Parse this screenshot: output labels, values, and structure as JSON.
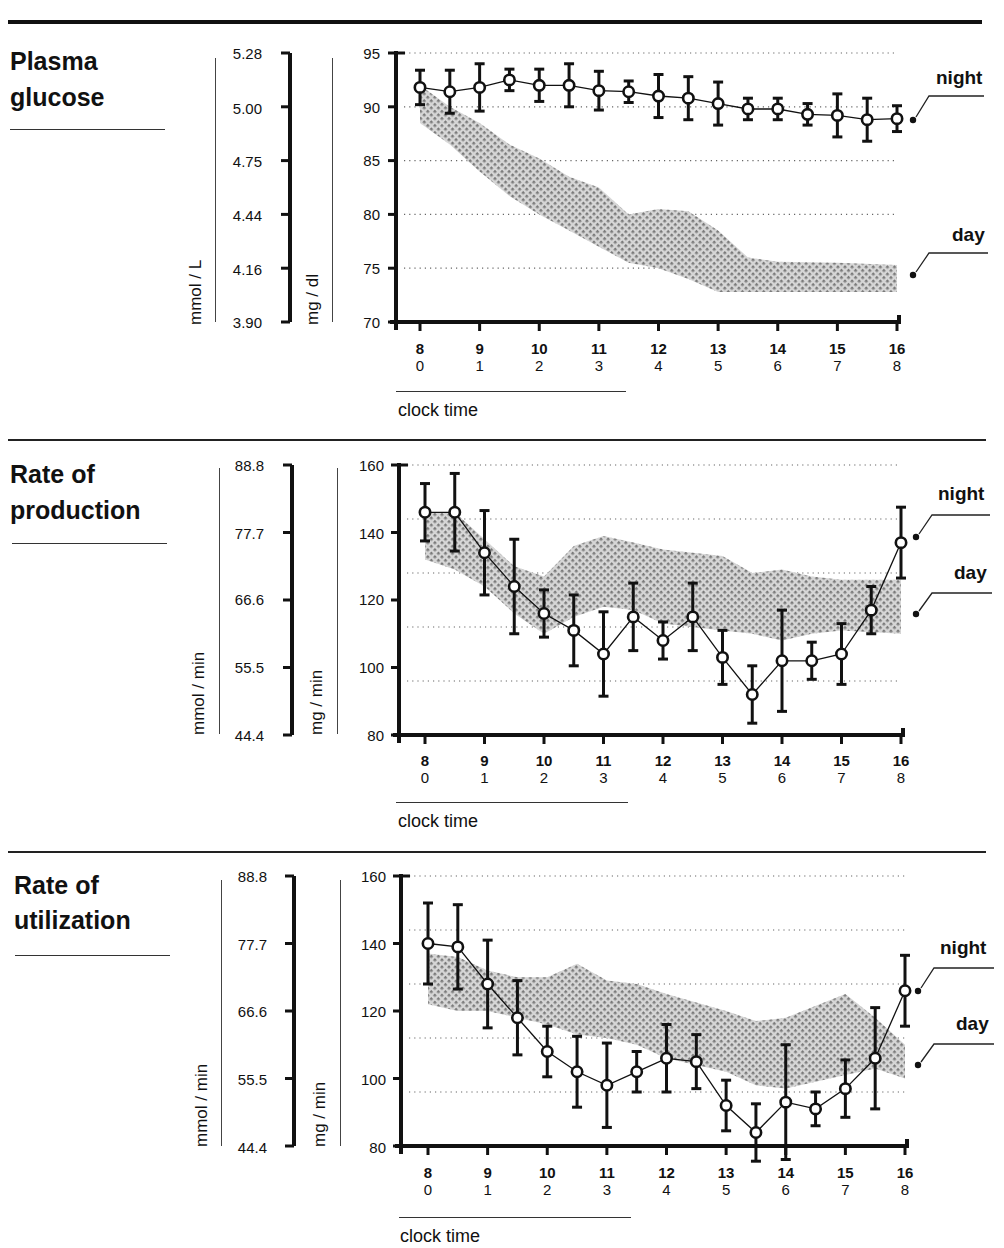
{
  "panels": [
    {
      "title_line1": "Plasma",
      "title_line2": "glucose",
      "left_unit": "mmol / L",
      "right_unit": "mg / dl",
      "left_ticks": [
        "5.28",
        "5.00",
        "4.75",
        "4.44",
        "4.16",
        "3.90"
      ],
      "right_ticks": [
        "95",
        "90",
        "85",
        "80",
        "75",
        "70"
      ],
      "legend_night": "night",
      "legend_day": "day",
      "x_clock": [
        "8",
        "9",
        "10",
        "11",
        "12",
        "13",
        "14",
        "15",
        "16"
      ],
      "x_hours": [
        "0",
        "1",
        "2",
        "3",
        "4",
        "5",
        "6",
        "7",
        "8"
      ],
      "x_caption": "clock time"
    },
    {
      "title_line1": "Rate of",
      "title_line2": "production",
      "left_unit": "mmol / min",
      "right_unit": "mg / min",
      "left_ticks": [
        "88.8",
        "77.7",
        "66.6",
        "55.5",
        "44.4"
      ],
      "right_ticks": [
        "160",
        "140",
        "120",
        "100",
        "80"
      ],
      "legend_night": "night",
      "legend_day": "day",
      "x_clock": [
        "8",
        "9",
        "10",
        "11",
        "12",
        "13",
        "14",
        "15",
        "16"
      ],
      "x_hours": [
        "0",
        "1",
        "2",
        "3",
        "4",
        "5",
        "6",
        "7",
        "8"
      ],
      "x_caption": "clock time"
    },
    {
      "title_line1": "Rate of",
      "title_line2": "utilization",
      "left_unit": "mmol / min",
      "right_unit": "mg / min",
      "left_ticks": [
        "88.8",
        "77.7",
        "66.6",
        "55.5",
        "44.4"
      ],
      "right_ticks": [
        "160",
        "140",
        "120",
        "100",
        "80"
      ],
      "legend_night": "night",
      "legend_day": "day",
      "x_clock": [
        "8",
        "9",
        "10",
        "11",
        "12",
        "13",
        "14",
        "15",
        "16"
      ],
      "x_hours": [
        "0",
        "1",
        "2",
        "3",
        "4",
        "5",
        "6",
        "7",
        "8"
      ],
      "x_caption": "clock time"
    }
  ],
  "chart_data": [
    {
      "type": "line",
      "title": "Plasma glucose",
      "xlabel": "clock time",
      "ylabel": "mg / dl",
      "ylabel_secondary": "mmol / L",
      "ylim": [
        70,
        95
      ],
      "x": [
        8,
        8.5,
        9,
        9.5,
        10,
        10.5,
        11,
        11.5,
        12,
        12.5,
        13,
        13.5,
        14,
        14.5,
        15,
        15.5,
        16
      ],
      "series": [
        {
          "name": "night",
          "style": "open-circles-with-error-bars",
          "values": [
            91.8,
            91.4,
            91.8,
            92.5,
            92.0,
            92.0,
            91.5,
            91.4,
            91.0,
            90.8,
            90.3,
            89.8,
            89.8,
            89.3,
            89.2,
            88.8,
            88.9
          ],
          "err": [
            1.6,
            2.0,
            2.2,
            1.0,
            1.5,
            2.0,
            1.8,
            1.0,
            2.0,
            2.0,
            2.0,
            1.0,
            1.0,
            1.0,
            2.0,
            2.0,
            1.2
          ]
        },
        {
          "name": "day",
          "style": "hatched-band",
          "upper": [
            92,
            90,
            88.5,
            86.5,
            85.2,
            83.5,
            82.5,
            80,
            80.5,
            80.3,
            78.5,
            76,
            75.6,
            75.5,
            75.3
          ],
          "lower": [
            88.5,
            86.5,
            84,
            81.7,
            80,
            78.5,
            77,
            75.5,
            75,
            74,
            72.8,
            72.8,
            72.8,
            72.8,
            72.8
          ],
          "band_x": [
            8,
            8.5,
            9,
            9.5,
            10,
            10.5,
            11,
            11.5,
            12,
            12.5,
            13,
            13.5,
            14,
            15,
            16
          ]
        }
      ],
      "gridlines": [
        75,
        80,
        85,
        90,
        95
      ],
      "grid": "dotted"
    },
    {
      "type": "line",
      "title": "Rate of production",
      "xlabel": "clock time",
      "ylabel": "mg / min",
      "ylabel_secondary": "mmol / min",
      "ylim": [
        80,
        160
      ],
      "x": [
        8,
        8.5,
        9,
        9.5,
        10,
        10.5,
        11,
        11.5,
        12,
        12.5,
        13,
        13.5,
        14,
        14.5,
        15,
        15.5,
        16
      ],
      "series": [
        {
          "name": "night",
          "style": "open-circles-with-error-bars",
          "values": [
            146,
            146,
            134,
            124,
            116,
            111,
            104,
            115,
            108,
            115,
            103,
            92,
            102,
            102,
            104,
            117,
            137
          ],
          "err": [
            8.5,
            11.5,
            12.5,
            14,
            7,
            10.5,
            12.5,
            10,
            5.5,
            10,
            8,
            8.5,
            15,
            5.5,
            9,
            7,
            10.5
          ]
        },
        {
          "name": "day",
          "style": "hatched-band",
          "upper": [
            146,
            146,
            138,
            130,
            127,
            136,
            139,
            137,
            135,
            133,
            128,
            129,
            127,
            126,
            126
          ],
          "lower": [
            132,
            129,
            124,
            116,
            110,
            115,
            118,
            117,
            113,
            111,
            110,
            108,
            110,
            111,
            110
          ],
          "band_x": [
            8,
            8.5,
            9,
            9.5,
            10,
            10.5,
            11,
            11.5,
            12,
            13,
            13.5,
            14,
            14.5,
            15,
            16
          ]
        }
      ],
      "gridlines": [
        96,
        112,
        128,
        144,
        160
      ],
      "grid": "dotted"
    },
    {
      "type": "line",
      "title": "Rate of utilization",
      "xlabel": "clock time",
      "ylabel": "mg / min",
      "ylabel_secondary": "mmol / min",
      "ylim": [
        80,
        160
      ],
      "x": [
        8,
        8.5,
        9,
        9.5,
        10,
        10.5,
        11,
        11.5,
        12,
        12.5,
        13,
        13.5,
        14,
        14.5,
        15,
        15.5,
        16
      ],
      "series": [
        {
          "name": "night",
          "style": "open-circles-with-error-bars",
          "values": [
            140,
            139,
            128,
            118,
            108,
            102,
            98,
            102,
            106,
            105,
            92,
            84,
            93,
            91,
            97,
            106,
            126
          ],
          "err": [
            12,
            12.5,
            13,
            11,
            7.5,
            10.5,
            12.5,
            6,
            10,
            8,
            7.5,
            8.5,
            17,
            5,
            8.5,
            15,
            10.5
          ]
        },
        {
          "name": "day",
          "style": "hatched-band",
          "upper": [
            137,
            136,
            132,
            130,
            130,
            134,
            129,
            128,
            125,
            120,
            117,
            118,
            125,
            118,
            110
          ],
          "lower": [
            122,
            120,
            120,
            118,
            116,
            113,
            112,
            110,
            106,
            102,
            98,
            97,
            101,
            103,
            100
          ],
          "band_x": [
            8,
            8.5,
            9,
            9.5,
            10,
            10.5,
            11,
            11.5,
            12,
            13,
            13.5,
            14,
            15,
            15.5,
            16
          ]
        }
      ],
      "gridlines": [
        96,
        112,
        128,
        144,
        160
      ],
      "grid": "dotted"
    }
  ]
}
